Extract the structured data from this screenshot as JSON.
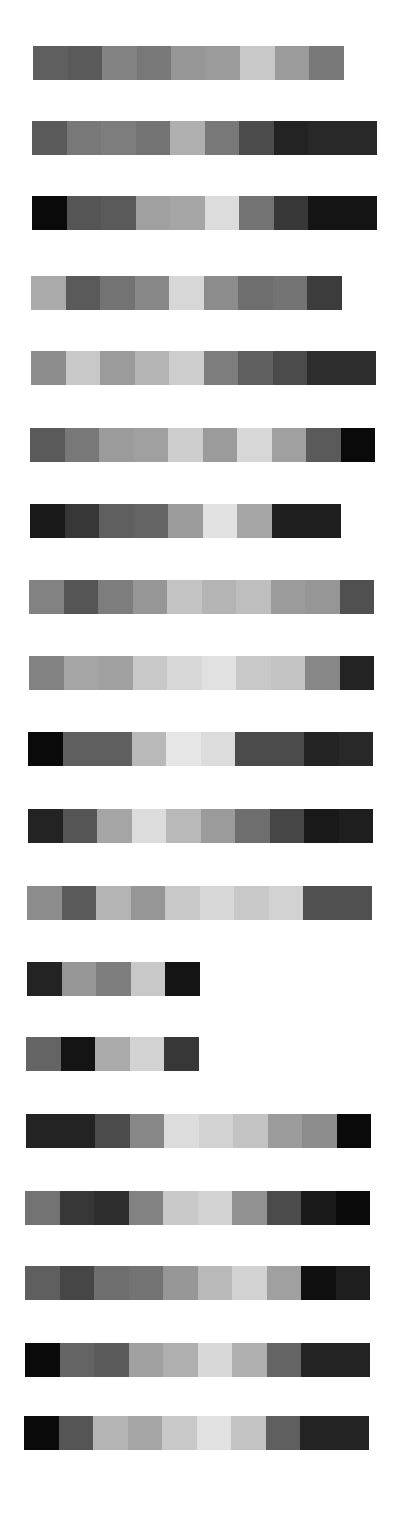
{
  "chart_data": {
    "type": "heatmap",
    "title": "",
    "rows": [
      {
        "x": 33,
        "y": 46,
        "values": [
          95,
          90,
          130,
          120,
          150,
          155,
          200,
          155,
          120
        ]
      },
      {
        "x": 32,
        "y": 121,
        "values": [
          90,
          120,
          125,
          115,
          175,
          120,
          75,
          35,
          40,
          40
        ]
      },
      {
        "x": 32,
        "y": 196,
        "values": [
          10,
          85,
          90,
          160,
          165,
          220,
          115,
          55,
          20,
          20
        ]
      },
      {
        "x": 31,
        "y": 276,
        "values": [
          170,
          90,
          115,
          135,
          215,
          140,
          110,
          115,
          60
        ]
      },
      {
        "x": 31,
        "y": 351,
        "values": [
          140,
          200,
          155,
          180,
          205,
          125,
          95,
          75,
          45,
          45
        ]
      },
      {
        "x": 30,
        "y": 428,
        "values": [
          90,
          120,
          155,
          160,
          205,
          155,
          215,
          160,
          90,
          10
        ]
      },
      {
        "x": 30,
        "y": 504,
        "values": [
          25,
          55,
          95,
          100,
          155,
          225,
          165,
          30,
          30
        ]
      },
      {
        "x": 29,
        "y": 580,
        "values": [
          130,
          85,
          125,
          150,
          195,
          180,
          190,
          155,
          150,
          80
        ]
      },
      {
        "x": 29,
        "y": 656,
        "values": [
          130,
          165,
          160,
          200,
          215,
          225,
          200,
          195,
          135,
          35
        ]
      },
      {
        "x": 28,
        "y": 732,
        "values": [
          10,
          95,
          95,
          185,
          230,
          220,
          75,
          75,
          35,
          40
        ]
      },
      {
        "x": 28,
        "y": 809,
        "values": [
          35,
          85,
          165,
          220,
          185,
          155,
          110,
          70,
          25,
          30
        ]
      },
      {
        "x": 27,
        "y": 886,
        "values": [
          140,
          90,
          180,
          150,
          200,
          215,
          200,
          210,
          80,
          80
        ]
      },
      {
        "x": 27,
        "y": 962,
        "values": [
          35,
          150,
          125,
          200,
          20
        ]
      },
      {
        "x": 26,
        "y": 1037,
        "values": [
          100,
          20,
          170,
          210,
          55
        ]
      },
      {
        "x": 26,
        "y": 1114,
        "values": [
          35,
          35,
          75,
          135,
          220,
          210,
          195,
          155,
          140,
          10
        ]
      },
      {
        "x": 25,
        "y": 1191,
        "values": [
          115,
          55,
          45,
          130,
          200,
          210,
          145,
          75,
          25,
          10
        ]
      },
      {
        "x": 25,
        "y": 1266,
        "values": [
          95,
          70,
          110,
          115,
          150,
          185,
          210,
          160,
          15,
          30
        ]
      },
      {
        "x": 25,
        "y": 1343,
        "values": [
          10,
          100,
          90,
          160,
          175,
          215,
          175,
          100,
          35,
          35
        ]
      },
      {
        "x": 24,
        "y": 1416,
        "values": [
          10,
          85,
          180,
          165,
          200,
          225,
          195,
          95,
          35,
          35
        ]
      }
    ],
    "cell_width": 34.5,
    "cell_height": 34
  }
}
